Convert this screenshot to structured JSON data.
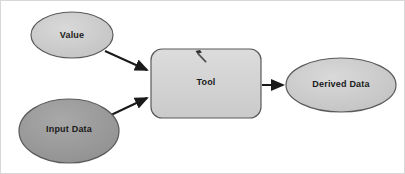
{
  "diagram": {
    "background_color": "#ffffff",
    "border_color": "#d8d8d8",
    "nodes": [
      {
        "id": "value",
        "label": "Value",
        "shape": "ellipse",
        "role": "input-variable",
        "fill_color": "#c9c9c9",
        "stroke_color": "#5a5a5a",
        "cx": 71,
        "cy": 34,
        "rx": 41,
        "ry": 23
      },
      {
        "id": "input-data",
        "label": "Input Data",
        "shape": "ellipse",
        "role": "input-data-variable",
        "fill_color": "#9a9a9a",
        "stroke_color": "#5a5a5a",
        "cx": 68,
        "cy": 130,
        "rx": 50,
        "ry": 32
      },
      {
        "id": "tool",
        "label": "Tool",
        "shape": "rounded-rectangle",
        "role": "tool-process",
        "fill_color": "#d2d2d2",
        "stroke_color": "#5a5a5a",
        "x": 150,
        "y": 48,
        "width": 110,
        "height": 69
      },
      {
        "id": "derived-data",
        "label": "Derived Data",
        "shape": "ellipse",
        "role": "derived-output-variable",
        "fill_color": "#c4c4c4",
        "stroke_color": "#5a5a5a",
        "cx": 340,
        "cy": 84,
        "rx": 55,
        "ry": 27
      }
    ],
    "connectors": [
      {
        "id": "value-to-tool",
        "from": "value",
        "to": "tool",
        "color": "#1a1a1a"
      },
      {
        "id": "input-data-to-tool",
        "from": "input-data",
        "to": "tool",
        "color": "#1a1a1a"
      },
      {
        "id": "tool-to-derived-data",
        "from": "tool",
        "to": "derived-data",
        "color": "#1a1a1a"
      }
    ],
    "tool_icon": {
      "name": "hammer-icon",
      "color": "#3a3a3a",
      "x": 192,
      "y": 48,
      "size": 16
    }
  }
}
